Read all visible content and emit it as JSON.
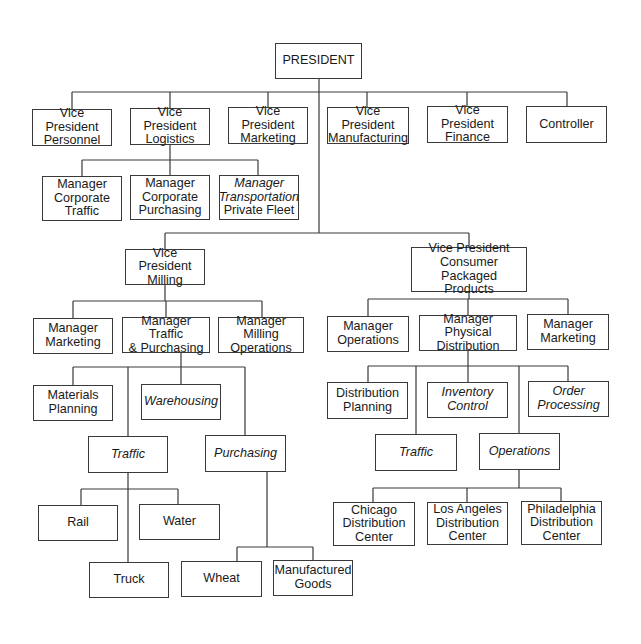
{
  "line_color": "#3a3a3a",
  "nodes": {
    "president": {
      "label": "PRESIDENT"
    },
    "vp_personnel": {
      "label": "Vice President\nPersonnel"
    },
    "vp_logistics": {
      "label": "Vice President\nLogistics"
    },
    "vp_marketing": {
      "label": "Vice President\nMarketing"
    },
    "vp_manufacturing": {
      "label": "Vice President\nManufacturing"
    },
    "vp_finance": {
      "label": "Vice President\nFinance"
    },
    "controller": {
      "label": "Controller"
    },
    "mgr_corporate_traffic": {
      "label": "Manager\nCorporate\nTraffic"
    },
    "mgr_corporate_purchasing": {
      "label": "Manager\nCorporate\nPurchasing"
    },
    "mgr_transportation": {
      "line1": "Manager",
      "line2": "Transportation",
      "line3": "Private Fleet"
    },
    "vp_milling": {
      "label": "Vice President\nMilling"
    },
    "vp_cpp": {
      "label": "Vice President\nConsumer Packaged\nProducts"
    },
    "milling_mgr_marketing": {
      "label": "Manager\nMarketing"
    },
    "milling_mgr_traffic_purchasing": {
      "label": "Manager Traffic\n& Purchasing"
    },
    "milling_mgr_operations": {
      "label": "Manager Milling\nOperations"
    },
    "materials_planning": {
      "label": "Materials\nPlanning"
    },
    "warehousing": {
      "label": "Warehousing"
    },
    "milling_traffic": {
      "label": "Traffic"
    },
    "milling_purchasing": {
      "label": "Purchasing"
    },
    "rail": {
      "label": "Rail"
    },
    "water": {
      "label": "Water"
    },
    "truck": {
      "label": "Truck"
    },
    "wheat": {
      "label": "Wheat"
    },
    "manufactured_goods": {
      "label": "Manufactured\nGoods"
    },
    "cpp_mgr_operations": {
      "label": "Manager\nOperations"
    },
    "cpp_mgr_physical_distribution": {
      "label": "Manager Physical\nDistribution"
    },
    "cpp_mgr_marketing": {
      "label": "Manager\nMarketing"
    },
    "distribution_planning": {
      "label": "Distribution\nPlanning"
    },
    "inventory_control": {
      "label": "Inventory\nControl"
    },
    "order_processing": {
      "label": "Order\nProcessing"
    },
    "cpp_traffic": {
      "label": "Traffic"
    },
    "cpp_operations": {
      "label": "Operations"
    },
    "chicago_dc": {
      "label": "Chicago\nDistribution\nCenter"
    },
    "los_angeles_dc": {
      "label": "Los Angeles\nDistribution\nCenter"
    },
    "philadelphia_dc": {
      "label": "Philadelphia\nDistribution\nCenter"
    }
  },
  "hierarchy": {
    "PRESIDENT": [
      "Vice President Personnel",
      "Vice President Logistics",
      "Vice President Marketing",
      "Vice President Manufacturing",
      "Vice President Finance",
      "Controller",
      "Vice President Milling",
      "Vice President Consumer Packaged Products"
    ],
    "Vice President Logistics": [
      "Manager Corporate Traffic",
      "Manager Corporate Purchasing",
      "Manager Transportation Private Fleet"
    ],
    "Vice President Milling": [
      "Manager Marketing",
      "Manager Traffic & Purchasing",
      "Manager Milling Operations"
    ],
    "Manager Traffic & Purchasing": [
      "Materials Planning",
      "Warehousing",
      "Traffic",
      "Purchasing"
    ],
    "Traffic (Milling)": [
      "Rail",
      "Water",
      "Truck"
    ],
    "Purchasing": [
      "Wheat",
      "Manufactured Goods"
    ],
    "Vice President Consumer Packaged Products": [
      "Manager Operations",
      "Manager Physical Distribution",
      "Manager Marketing"
    ],
    "Manager Physical Distribution": [
      "Distribution Planning",
      "Inventory Control",
      "Order Processing",
      "Traffic",
      "Operations"
    ],
    "Operations (CPP)": [
      "Chicago Distribution Center",
      "Los Angeles Distribution Center",
      "Philadelphia Distribution Center"
    ]
  }
}
